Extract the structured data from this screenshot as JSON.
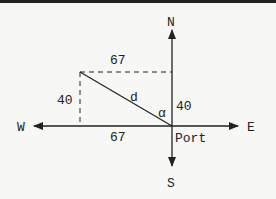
{
  "diagram": {
    "compass": {
      "north": "N",
      "south": "S",
      "east": "E",
      "west": "W"
    },
    "origin_label": "Port",
    "labels": {
      "top_horizontal": "67",
      "bottom_horizontal": "67",
      "left_vertical": "40",
      "right_vertical": "40",
      "hypotenuse": "d",
      "angle": "α"
    },
    "colors": {
      "line": "#222222",
      "background": "#f7f7f5"
    }
  }
}
